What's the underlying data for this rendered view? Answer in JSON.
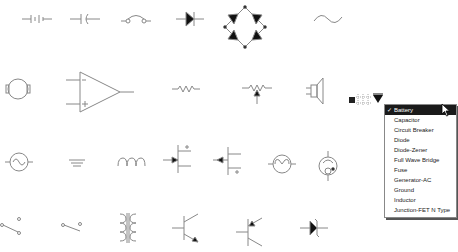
{
  "palette": {
    "symbols": [
      {
        "name": "battery-symbol"
      },
      {
        "name": "capacitor-symbol"
      },
      {
        "name": "circuit-breaker-symbol"
      },
      {
        "name": "diode-symbol"
      },
      {
        "name": "full-wave-bridge-symbol"
      },
      {
        "name": "fuse-symbol"
      },
      {
        "name": "motor-symbol"
      },
      {
        "name": "op-amp-symbol"
      },
      {
        "name": "resistor-symbol"
      },
      {
        "name": "potentiometer-symbol"
      },
      {
        "name": "speaker-symbol"
      },
      {
        "name": "generator-ac-symbol"
      },
      {
        "name": "ground-symbol"
      },
      {
        "name": "inductor-symbol"
      },
      {
        "name": "jfet-n-symbol"
      },
      {
        "name": "jfet-p-symbol"
      },
      {
        "name": "lamp-symbol"
      },
      {
        "name": "phototube-symbol"
      },
      {
        "name": "switch-spdt-symbol"
      },
      {
        "name": "switch-spst-symbol"
      },
      {
        "name": "transformer-symbol"
      },
      {
        "name": "transistor-npn-symbol"
      },
      {
        "name": "transistor-pnp-symbol"
      },
      {
        "name": "diode-zener-symbol"
      }
    ]
  },
  "dropdown": {
    "selected": "Battery",
    "check_glyph": "✓",
    "items": [
      "Battery",
      "Capacitor",
      "Circuit Breaker",
      "Diode",
      "Diode-Zener",
      "Full Wave Bridge",
      "Fuse",
      "Generator-AC",
      "Ground",
      "Inductor",
      "Junction-FET N Type"
    ]
  },
  "colors": {
    "stroke": "#888888",
    "fill_dark": "#111111",
    "selected_bg": "#1a1a1a"
  }
}
